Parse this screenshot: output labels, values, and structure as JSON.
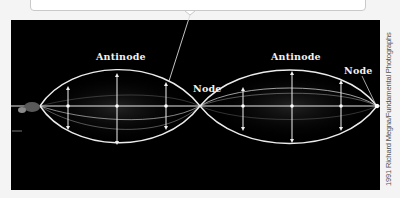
{
  "figure": {
    "type": "standing-wave-photograph",
    "background_color": "#000000",
    "wave_color": "#e6e6e6",
    "labels": {
      "antinode_left": "Antinode",
      "node_middle": "Node",
      "antinode_right": "Antinode",
      "node_right": "Node"
    },
    "credit": "1991 Richard Megna/Fundamental Photographs"
  },
  "callout": {
    "text": ""
  }
}
